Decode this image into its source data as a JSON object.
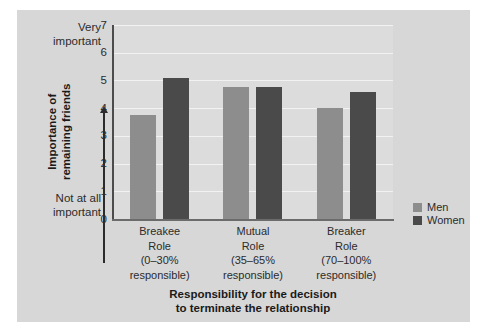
{
  "chart_data": {
    "type": "bar",
    "title": "",
    "subtitle": "",
    "categories": [
      "Breakee\nRole\n(0–30%\nresponsible)",
      "Mutual\nRole\n(35–65%\nresponsible)",
      "Breaker\nRole\n(70–100%\nresponsible)"
    ],
    "category_lines": [
      [
        "Breakee",
        "Role",
        "(0–30%",
        "responsible)"
      ],
      [
        "Mutual",
        "Role",
        "(35–65%",
        "responsible)"
      ],
      [
        "Breaker",
        "Role",
        "(70–100%",
        "responsible)"
      ]
    ],
    "series": [
      {
        "name": "Men",
        "color": "#8d8d8d",
        "values": [
          3.75,
          4.75,
          4.0
        ]
      },
      {
        "name": "Women",
        "color": "#4a4a4a",
        "values": [
          5.1,
          4.75,
          4.6
        ]
      }
    ],
    "xlabel": "Responsibility for the decision to terminate the relationship",
    "xlabel_lines": [
      "Responsibility for the decision",
      "to terminate the relationship"
    ],
    "ylabel": "Importance of remaining friends",
    "ylabel_lines": [
      "Importance of",
      "remaining friends"
    ],
    "ylim": [
      0,
      7
    ],
    "yticks": [
      7,
      6,
      5,
      4,
      3,
      2,
      1,
      0
    ],
    "ytick_labels": [
      "7",
      "6",
      "5",
      "4",
      "3",
      "2",
      "1",
      "0"
    ],
    "y_axis_anchor_high": "Very important",
    "y_axis_anchor_high_lines": [
      "Very",
      "important"
    ],
    "y_axis_anchor_low": "Not at all important",
    "y_axis_anchor_low_lines": [
      "Not at all",
      "important"
    ],
    "grid": true,
    "gridline_color": "#f2f2f2",
    "legend_position": "right",
    "legend": [
      {
        "label": "Men",
        "color": "#8d8d8d"
      },
      {
        "label": "Women",
        "color": "#4a4a4a"
      }
    ],
    "panel_background": "#d7d7d7",
    "plot_background": "#dcdcdc"
  }
}
